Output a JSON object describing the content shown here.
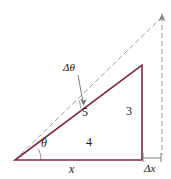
{
  "figure": {
    "type": "geometry-diagram",
    "background_color": "#ffffff",
    "colors": {
      "triangle_stroke": "#7d2b3d",
      "dashed_stroke": "#9b9b9b",
      "arc_stroke": "#8a8a8a",
      "label_color": "#1a1a1a"
    },
    "labels": {
      "delta_theta": "Δθ",
      "hypotenuse": "5",
      "vertical_leg": "3",
      "theta": "θ",
      "horizontal_leg": "4",
      "x": "x",
      "delta_x": "Δx"
    },
    "geometry": {
      "vertex_left": [
        15,
        160
      ],
      "vertex_bottom_right": [
        142,
        160
      ],
      "vertex_top_right": [
        142,
        65
      ],
      "dashed_ray_end": [
        162,
        17
      ],
      "dashed_vertical_bottom": [
        162,
        155
      ],
      "measure_line_y": 158,
      "measure_line_x_start": 143,
      "measure_line_x_end": 162,
      "theta_arc_radius": 26,
      "delta_theta_arc_radius": 70,
      "leader_line_from": [
        78,
        74
      ],
      "leader_line_to": [
        83,
        101
      ]
    }
  }
}
